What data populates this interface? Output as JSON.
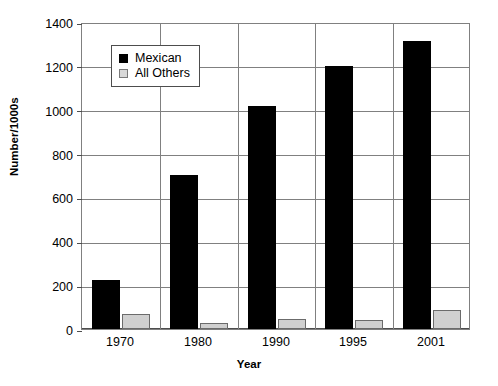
{
  "chart_data": {
    "type": "bar",
    "title": "",
    "xlabel": "Year",
    "ylabel": "Number/1000s",
    "categories": [
      "1970",
      "1980",
      "1990",
      "1995",
      "2001"
    ],
    "series": [
      {
        "name": "Mexican",
        "color": "#000000",
        "values": [
          225,
          700,
          1015,
          1200,
          1315
        ]
      },
      {
        "name": "All Others",
        "color": "#d0d0d0",
        "values": [
          70,
          28,
          45,
          41,
          85
        ]
      }
    ],
    "ylim": [
      0,
      1400
    ],
    "ytick_labels": [
      "0",
      "200",
      "400",
      "600",
      "800",
      "1000",
      "1200",
      "1400"
    ],
    "ytick_values": [
      0,
      200,
      400,
      600,
      800,
      1000,
      1200,
      1400
    ],
    "grid": true,
    "legend_position": "upper left"
  },
  "legend": {
    "entries": [
      {
        "label": "Mexican",
        "swatch": "black-square-icon"
      },
      {
        "label": "All Others",
        "swatch": "gray-square-icon"
      }
    ]
  }
}
